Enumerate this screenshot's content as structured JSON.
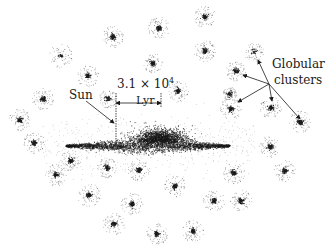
{
  "figure": {
    "type": "diagram",
    "background": "#ffffff",
    "ink_color": "#1a1a1a"
  },
  "labels": {
    "sun": "Sun",
    "scale_value": "3.1 × 10",
    "scale_exponent": "4",
    "scale_unit": "Lyr",
    "globular_line1": "Globular",
    "globular_line2": "clusters"
  },
  "galaxy": {
    "disk": {
      "cx": 148,
      "cy": 146,
      "half_length": 82,
      "half_thickness": 7
    },
    "bulge": {
      "cx": 160,
      "cy": 139,
      "rx": 28,
      "ry": 8
    },
    "sun_position": {
      "x": 116,
      "y": 146
    },
    "scale_bar": {
      "x1": 116,
      "x2": 161,
      "y": 103,
      "tick_top": 93,
      "tick_bottom": 146
    }
  },
  "globular_clusters": [
    {
      "x": 159,
      "y": 28,
      "r": 11,
      "core": 3
    },
    {
      "x": 205,
      "y": 17,
      "r": 11,
      "core": 3
    },
    {
      "x": 113,
      "y": 37,
      "r": 11,
      "core": 3
    },
    {
      "x": 61,
      "y": 56,
      "r": 12,
      "core": 1
    },
    {
      "x": 153,
      "y": 63,
      "r": 10,
      "core": 3
    },
    {
      "x": 205,
      "y": 51,
      "r": 11,
      "core": 3
    },
    {
      "x": 88,
      "y": 76,
      "r": 11,
      "core": 3
    },
    {
      "x": 108,
      "y": 99,
      "r": 9,
      "core": 2
    },
    {
      "x": 43,
      "y": 99,
      "r": 11,
      "core": 3
    },
    {
      "x": 20,
      "y": 120,
      "r": 11,
      "core": 3
    },
    {
      "x": 178,
      "y": 91,
      "r": 11,
      "core": 3
    },
    {
      "x": 254,
      "y": 52,
      "r": 10,
      "core": 1
    },
    {
      "x": 236,
      "y": 71,
      "r": 10,
      "core": 3
    },
    {
      "x": 230,
      "y": 94,
      "r": 7,
      "core": 2
    },
    {
      "x": 231,
      "y": 109,
      "r": 11,
      "core": 3
    },
    {
      "x": 271,
      "y": 108,
      "r": 11,
      "core": 3
    },
    {
      "x": 300,
      "y": 122,
      "r": 11,
      "core": 3
    },
    {
      "x": 34,
      "y": 143,
      "r": 11,
      "core": 3
    },
    {
      "x": 71,
      "y": 161,
      "r": 11,
      "core": 3
    },
    {
      "x": 56,
      "y": 175,
      "r": 11,
      "core": 3
    },
    {
      "x": 107,
      "y": 168,
      "r": 10,
      "core": 3
    },
    {
      "x": 139,
      "y": 170,
      "r": 11,
      "core": 3
    },
    {
      "x": 89,
      "y": 195,
      "r": 12,
      "core": 3
    },
    {
      "x": 132,
      "y": 204,
      "r": 11,
      "core": 3
    },
    {
      "x": 114,
      "y": 224,
      "r": 11,
      "core": 3
    },
    {
      "x": 157,
      "y": 234,
      "r": 11,
      "core": 3
    },
    {
      "x": 270,
      "y": 147,
      "r": 11,
      "core": 3
    },
    {
      "x": 285,
      "y": 171,
      "r": 11,
      "core": 3
    },
    {
      "x": 234,
      "y": 173,
      "r": 11,
      "core": 3
    },
    {
      "x": 175,
      "y": 186,
      "r": 11,
      "core": 3
    },
    {
      "x": 214,
      "y": 201,
      "r": 11,
      "core": 3
    },
    {
      "x": 241,
      "y": 201,
      "r": 11,
      "core": 3
    },
    {
      "x": 193,
      "y": 231,
      "r": 11,
      "core": 3
    },
    {
      "x": 302,
      "y": 125,
      "r": 0,
      "core": 0
    }
  ],
  "arrows": {
    "sun": {
      "x1": 86,
      "y1": 101,
      "x2": 114,
      "y2": 123
    },
    "globular_origin": {
      "x": 269,
      "y": 84
    },
    "globular_targets": [
      {
        "x": 258,
        "y": 60
      },
      {
        "x": 243,
        "y": 75
      },
      {
        "x": 238,
        "y": 102
      },
      {
        "x": 272,
        "y": 101
      },
      {
        "x": 300,
        "y": 119
      }
    ]
  }
}
